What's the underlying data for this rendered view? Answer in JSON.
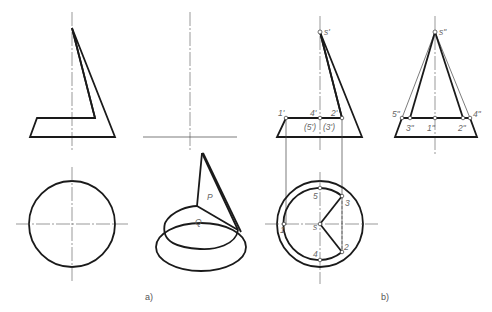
{
  "figure": {
    "captions": {
      "a": "a)",
      "b": "b)"
    },
    "panel_a": {
      "perspective_labels": {
        "plane_p": "P",
        "plane_q": "Q"
      }
    },
    "panel_b": {
      "front_view_labels": {
        "apex": "s'",
        "p1": "1'",
        "p4": "4'",
        "p2": "2'",
        "p5_3_hidden": "(5')",
        "p3_hidden": "(3')"
      },
      "side_view_labels": {
        "apex": "s\"",
        "p5": "5\"",
        "p4": "4\"",
        "p3": "3\"",
        "p1": "1\"",
        "p2": "2\""
      },
      "top_view_labels": {
        "center": "s",
        "p1": "1",
        "p2": "2",
        "p3": "3",
        "p4": "4",
        "p5": "5"
      }
    }
  }
}
